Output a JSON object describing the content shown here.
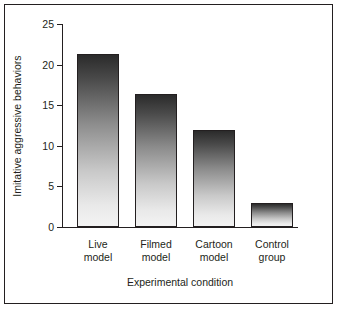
{
  "chart_data": {
    "type": "bar",
    "title": "",
    "xlabel": "Experimental condition",
    "ylabel": "Imitative aggressive behaviors",
    "categories": [
      "Live model",
      "Filmed model",
      "Cartoon model",
      "Control group"
    ],
    "category_lines": [
      [
        "Live",
        "model"
      ],
      [
        "Filmed",
        "model"
      ],
      [
        "Cartoon",
        "model"
      ],
      [
        "Control",
        "group"
      ]
    ],
    "values": [
      21.3,
      16.4,
      12.0,
      2.9
    ],
    "ylim": [
      0,
      25
    ],
    "yticks": [
      0,
      5,
      10,
      15,
      20,
      25
    ],
    "ytick_labels": [
      "0",
      "5",
      "10",
      "15",
      "20",
      "25"
    ],
    "grid": false,
    "legend": null,
    "bar_fill": "#9a9a9a",
    "bar_edge": "#231f20",
    "axis_color": "#231f20",
    "background": "#ffffff"
  }
}
